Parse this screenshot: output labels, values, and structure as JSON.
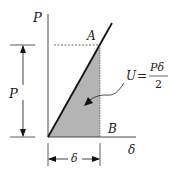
{
  "diagram": {
    "axis_labels": {
      "vertical": "P",
      "horizontal": "δ"
    },
    "points": {
      "A": "A",
      "B": "B"
    },
    "dimension_labels": {
      "load": "P",
      "displacement": "δ"
    },
    "equation": {
      "lhs": "U",
      "equals": "=",
      "numerator": "Pδ",
      "denominator": "2"
    },
    "colors": {
      "fill": "#b4b4b4",
      "line": "#111111",
      "text": "#222222"
    }
  }
}
